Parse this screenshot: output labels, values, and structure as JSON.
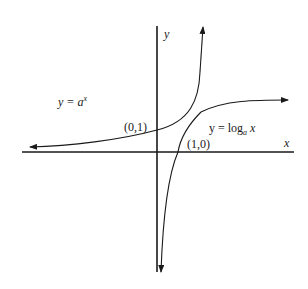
{
  "diagram": {
    "axes": {
      "x_label": "x",
      "y_label": "y"
    },
    "curves": [
      {
        "name": "exponential",
        "label_lhs": "y = ",
        "label_base": "a",
        "label_exp": "x",
        "point_label": "(0,1)"
      },
      {
        "name": "logarithm",
        "label_lhs": "y = log",
        "label_sub": "a",
        "label_arg": " x",
        "point_label": "(1,0)"
      }
    ],
    "colors": {
      "line": "#1a1a1a",
      "background": "#ffffff"
    }
  }
}
